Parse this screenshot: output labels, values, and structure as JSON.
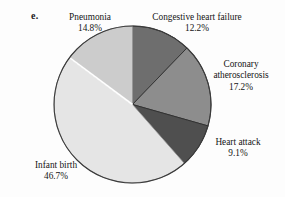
{
  "figure": {
    "part_label": "e."
  },
  "chart_data": {
    "type": "pie",
    "title": "",
    "subtitle": "",
    "xlabel": "",
    "ylabel": "",
    "units": "percent",
    "legend_position": "none",
    "labels_position": "outside-callout",
    "grid": false,
    "start_angle_deg": 0,
    "direction": "clockwise",
    "categories": [
      "Congestive heart failure",
      "Coronary atherosclerosis",
      "Heart attack",
      "Infant birth",
      "Pneumonia"
    ],
    "values": [
      12.2,
      17.2,
      9.1,
      46.7,
      14.8
    ],
    "value_labels": [
      "12.2%",
      "17.2%",
      "9.1%",
      "46.7%",
      "14.8%"
    ],
    "colors": [
      "#6e6e6e",
      "#8d8d8d",
      "#4f4f4f",
      "#e5e5e5",
      "#cccccc"
    ],
    "slices": [
      {
        "name": "Congestive heart failure",
        "value": 12.2,
        "value_label": "12.2%",
        "color": "#6e6e6e",
        "start_deg": 0.0,
        "end_deg": 43.92
      },
      {
        "name": "Coronary atherosclerosis",
        "value": 17.2,
        "value_label": "17.2%",
        "color": "#8d8d8d",
        "start_deg": 43.92,
        "end_deg": 105.84
      },
      {
        "name": "Heart attack",
        "value": 9.1,
        "value_label": "9.1%",
        "color": "#4f4f4f",
        "start_deg": 105.84,
        "end_deg": 138.6
      },
      {
        "name": "Infant birth",
        "value": 46.7,
        "value_label": "46.7%",
        "color": "#e5e5e5",
        "start_deg": 138.6,
        "end_deg": 306.72
      },
      {
        "name": "Pneumonia",
        "value": 14.8,
        "value_label": "14.8%",
        "color": "#cccccc",
        "start_deg": 306.72,
        "end_deg": 360.0
      }
    ]
  },
  "callouts": {
    "pneumonia": {
      "label": "Pneumonia",
      "value": "14.8%"
    },
    "congestive_heart_failure": {
      "label": "Congestive heart failure",
      "value": "12.2%"
    },
    "coronary_atherosclerosis": {
      "label_line1": "Coronary",
      "label_line2": "atherosclerosis",
      "value": "17.2%"
    },
    "heart_attack": {
      "label": "Heart attack",
      "value": "9.1%"
    },
    "infant_birth": {
      "label": "Infant birth",
      "value": "46.7%"
    }
  }
}
